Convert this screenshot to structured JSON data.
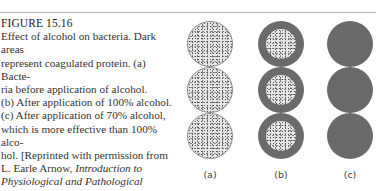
{
  "figure": {
    "number": "FIGURE 15.16",
    "caption_lines": [
      "Effect of alcohol on bacteria. Dark areas",
      "represent coagulated protein. (a) Bacte-",
      "ria before application of alcohol.",
      "(b) After application of 100% alcohol.",
      "(c) After application of 70% alcohol,",
      "which is more effective than 100% alco-",
      "hol. [Reprinted with permission from",
      "L. Earle Arnow, "
    ],
    "citation_title_part1": "Introduction to",
    "citation_title_part2": "Physiological and Pathological Chemistry,",
    "citation_end": "9th ed. St. Louis: C. V. Mosby Co., 1976.]",
    "panels": [
      {
        "label": "(a)",
        "description": "bacteria before alcohol - speckled, no coagulation"
      },
      {
        "label": "(b)",
        "description": "after 100% alcohol - dark coagulated outer ring"
      },
      {
        "label": "(c)",
        "description": "after 70% alcohol - fully dark, completely coagulated"
      }
    ],
    "colors": {
      "coagulated": "#6a6a6a",
      "protoplasm": "#e6e6e6",
      "rule": "#b8b8b8"
    }
  }
}
